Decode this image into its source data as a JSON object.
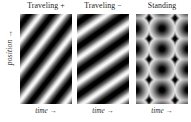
{
  "figure": {
    "axis_labels": {
      "y": "position →",
      "x": "time →"
    },
    "panels": [
      {
        "title": "Traveling  +",
        "xlabel": "time →",
        "pattern": "diagonal-grating-positive-slope"
      },
      {
        "title": "Traveling  −",
        "xlabel": "time →",
        "pattern": "diagonal-grating-positive-slope-steep"
      },
      {
        "title": "Standing",
        "xlabel": "time →",
        "pattern": "checkerboard-blobs"
      }
    ]
  },
  "chart_data": {
    "type": "heatmap",
    "title": "",
    "xlabel": "time →",
    "ylabel": "position →",
    "grid": false,
    "legend": "none",
    "colormap": [
      "#ffffff",
      "#000000"
    ],
    "colormap_name": "grayscale-white-to-black",
    "panels": [
      {
        "name": "Traveling  +",
        "function": "cos(k*x - w*t)",
        "orientation_deg": 38,
        "stripe_slope": "positive",
        "cycles_across_width": 2.0,
        "cycles_down_height": 3.5,
        "xlabel": "time →",
        "ylabel": "position →"
      },
      {
        "name": "Traveling  −",
        "function": "cos(k*x + w*t)",
        "orientation_deg": 55,
        "stripe_slope": "positive",
        "cycles_across_width": 2.0,
        "cycles_down_height": 3.0,
        "xlabel": "time →",
        "ylabel": "position →"
      },
      {
        "name": "Standing",
        "function": "cos(k*x)*cos(w*t)",
        "stripe_slope": "none",
        "blob_columns": 2,
        "blob_rows": 4.5,
        "xlabel": "time →",
        "ylabel": "position →"
      }
    ]
  }
}
